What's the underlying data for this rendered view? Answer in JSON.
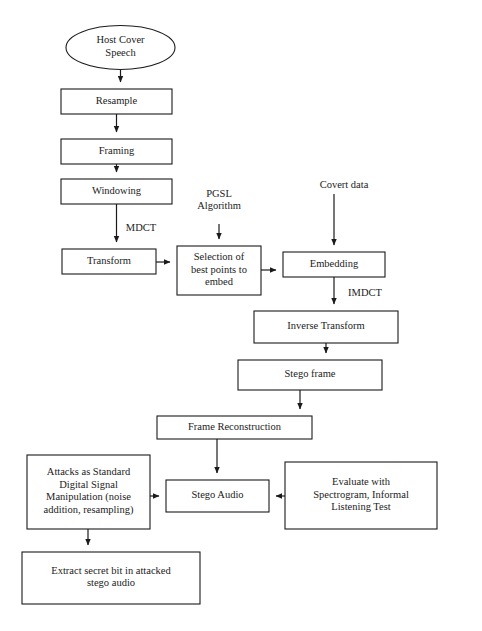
{
  "diagram": {
    "background_color": "#ffffff",
    "stroke_color": "#1b1b1b",
    "fill_color": "#ffffff",
    "nodes": [
      {
        "id": "host-cover-speech",
        "shape": "ellipse",
        "lines": [
          "Host Cover",
          "Speech"
        ],
        "cx": 120.5,
        "cy": 47.5,
        "rx": 54.5,
        "ry": 22
      },
      {
        "id": "resample",
        "shape": "rect",
        "lines": [
          "Resample"
        ],
        "x": 61,
        "y": 89,
        "w": 111,
        "h": 25
      },
      {
        "id": "framing",
        "shape": "rect",
        "lines": [
          "Framing"
        ],
        "x": 61,
        "y": 139,
        "w": 111,
        "h": 25
      },
      {
        "id": "windowing",
        "shape": "rect",
        "lines": [
          "Windowing"
        ],
        "x": 61,
        "y": 179,
        "w": 111,
        "h": 25
      },
      {
        "id": "transform",
        "shape": "rect",
        "lines": [
          "Transform"
        ],
        "x": 62,
        "y": 249,
        "w": 94,
        "h": 25
      },
      {
        "id": "selection-of-best-points",
        "shape": "rect",
        "lines": [
          "Selection of",
          "best points to",
          "embed"
        ],
        "x": 177,
        "y": 246,
        "w": 84,
        "h": 49
      },
      {
        "id": "embedding",
        "shape": "rect",
        "lines": [
          "Embedding"
        ],
        "x": 283,
        "y": 252,
        "w": 102,
        "h": 25
      },
      {
        "id": "inverse-transform",
        "shape": "rect",
        "lines": [
          "Inverse Transform"
        ],
        "x": 254,
        "y": 311,
        "w": 144,
        "h": 32
      },
      {
        "id": "stego-frame",
        "shape": "rect",
        "lines": [
          "Stego frame"
        ],
        "x": 238,
        "y": 360,
        "w": 144,
        "h": 30
      },
      {
        "id": "frame-reconstruction",
        "shape": "rect",
        "lines": [
          "Frame Reconstruction"
        ],
        "x": 157,
        "y": 416,
        "w": 155,
        "h": 23
      },
      {
        "id": "attacks-as-standard-dsp",
        "shape": "rect",
        "lines": [
          "Attacks as Standard",
          "Digital Signal",
          "Manipulation (noise",
          "addition, resampling)"
        ],
        "x": 27,
        "y": 455,
        "w": 123,
        "h": 74
      },
      {
        "id": "stego-audio",
        "shape": "rect",
        "lines": [
          "Stego Audio"
        ],
        "x": 166,
        "y": 480,
        "w": 103,
        "h": 32
      },
      {
        "id": "evaluate-with-spectrogram",
        "shape": "rect",
        "lines": [
          "Evaluate with",
          "Spectrogram, Informal",
          "Listening Test"
        ],
        "x": 285,
        "y": 462,
        "w": 152,
        "h": 67
      },
      {
        "id": "extract-secret-bit",
        "shape": "rect",
        "lines": [
          "Extract secret bit in attacked",
          "stego audio"
        ],
        "x": 22,
        "y": 552,
        "w": 178,
        "h": 52
      }
    ],
    "free_labels": [
      {
        "id": "pgsl-algorithm-label",
        "lines": [
          "PGSL",
          "Algorithm"
        ],
        "cx": 219,
        "cy": 201
      },
      {
        "id": "covert-data-label",
        "lines": [
          "Covert data"
        ],
        "cx": 344,
        "cy": 186
      },
      {
        "id": "mdct-label",
        "lines": [
          "MDCT"
        ],
        "cx": 141,
        "cy": 229
      },
      {
        "id": "imdct-label",
        "lines": [
          "IMDCT"
        ],
        "cx": 365,
        "cy": 294
      }
    ],
    "edges": [
      {
        "id": "edge-host-to-resample",
        "from": "host-cover-speech",
        "to": "resample",
        "d": "M 120.5 70 L 120.5 82"
      },
      {
        "id": "edge-resample-to-framing",
        "from": "resample",
        "to": "framing",
        "d": "M 116.5 114 L 116.5 132"
      },
      {
        "id": "edge-framing-to-windowing",
        "from": "framing",
        "to": "windowing",
        "d": "M 116.5 164 L 116.5 172"
      },
      {
        "id": "edge-windowing-to-transform",
        "from": "windowing",
        "to": "transform",
        "label": "MDCT",
        "d": "M 116.5 204 L 116.5 242"
      },
      {
        "id": "edge-transform-to-selection",
        "from": "transform",
        "to": "selection-of-best-points",
        "d": "M 156 262 L 170 262"
      },
      {
        "id": "edge-pgsl-to-selection",
        "from": "pgsl-algorithm-label",
        "to": "selection-of-best-points",
        "d": "M 219 224 L 219 239"
      },
      {
        "id": "edge-selection-to-embedding",
        "from": "selection-of-best-points",
        "to": "embedding",
        "d": "M 261 270 L 276 270"
      },
      {
        "id": "edge-covert-to-embedding",
        "from": "covert-data-label",
        "to": "embedding",
        "d": "M 334 194 L 334 245"
      },
      {
        "id": "edge-embedding-to-inverse",
        "from": "embedding",
        "to": "inverse-transform",
        "label": "IMDCT",
        "d": "M 334 277 L 334 304"
      },
      {
        "id": "edge-inverse-to-stegoframe",
        "from": "inverse-transform",
        "to": "stego-frame",
        "d": "M 326 343 L 326 353"
      },
      {
        "id": "edge-stegoframe-to-framerecon",
        "from": "stego-frame",
        "to": "frame-reconstruction",
        "d": "M 300 390 L 300 409"
      },
      {
        "id": "edge-framerecon-to-stegoaudio",
        "from": "frame-reconstruction",
        "to": "stego-audio",
        "d": "M 217 439 L 217 473"
      },
      {
        "id": "edge-attacks-to-stegoaudio",
        "from": "attacks-as-standard-dsp",
        "to": "stego-audio",
        "d": "M 150 496 L 159 496"
      },
      {
        "id": "edge-evaluate-to-stegoaudio",
        "from": "evaluate-with-spectrogram",
        "to": "stego-audio",
        "d": "M 285 496 L 276 496"
      },
      {
        "id": "edge-attacks-to-extract",
        "from": "attacks-as-standard-dsp",
        "to": "extract-secret-bit",
        "d": "M 88 529 L 88 545"
      }
    ]
  }
}
